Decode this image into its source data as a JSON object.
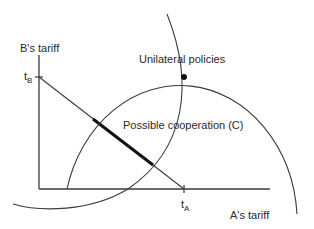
{
  "diagram": {
    "y_axis_label": "B's tariff",
    "x_axis_label": "A's tariff",
    "y_tick": {
      "base": "t",
      "subscript": "B"
    },
    "x_tick": {
      "base": "t",
      "subscript": "A"
    },
    "annotations": {
      "unilateral": "Unilateral policies",
      "cooperation": "Possible cooperation (C)"
    },
    "colors": {
      "line": "#3a3a3a",
      "thick_segment": "#111111",
      "text": "#2a2a2a",
      "background": "#ffffff"
    }
  }
}
